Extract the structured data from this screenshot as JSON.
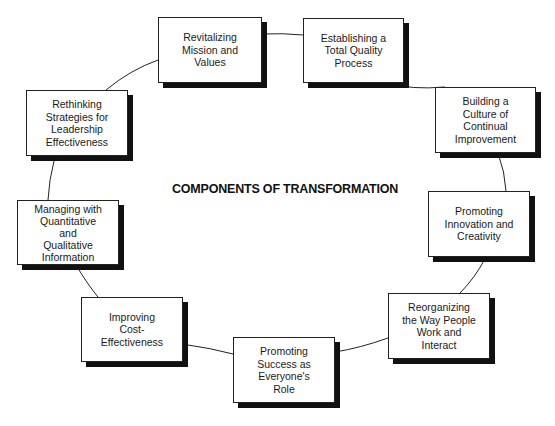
{
  "diagram": {
    "title": "COMPONENTS OF TRANSFORMATION",
    "colors": {
      "stroke": "#222222",
      "shadow": "#111111",
      "background": "#ffffff"
    },
    "nodes": [
      {
        "id": "revitalizing",
        "label": "Revitalizing\nMission and\nValues",
        "x": 158,
        "y": 17,
        "w": 104,
        "h": 66
      },
      {
        "id": "establishing",
        "label": "Establishing a\nTotal Quality\nProcess",
        "x": 303,
        "y": 18,
        "w": 101,
        "h": 65
      },
      {
        "id": "building",
        "label": "Building a\nCulture of\nContinual\nImprovement",
        "x": 435,
        "y": 87,
        "w": 101,
        "h": 66
      },
      {
        "id": "promoting-innovation",
        "label": "Promoting\nInnovation and\nCreativity",
        "x": 428,
        "y": 191,
        "w": 102,
        "h": 66
      },
      {
        "id": "reorganizing",
        "label": "Reorganizing\nthe Way People\nWork and\nInteract",
        "x": 388,
        "y": 293,
        "w": 102,
        "h": 66
      },
      {
        "id": "promoting-success",
        "label": "Promoting\nSuccess as\nEveryone's\nRole",
        "x": 233,
        "y": 337,
        "w": 102,
        "h": 66
      },
      {
        "id": "improving",
        "label": "Improving\nCost-\nEffectiveness",
        "x": 81,
        "y": 297,
        "w": 102,
        "h": 65
      },
      {
        "id": "managing",
        "label": "Managing with\nQuantitative\nand\nQualitative\nInformation",
        "x": 17,
        "y": 200,
        "w": 102,
        "h": 65
      },
      {
        "id": "rethinking",
        "label": "Rethinking\nStrategies for\nLeadership\nEffectiveness",
        "x": 26,
        "y": 90,
        "w": 102,
        "h": 66
      }
    ],
    "edges": [
      [
        "revitalizing",
        "establishing"
      ],
      [
        "establishing",
        "building"
      ],
      [
        "building",
        "promoting-innovation"
      ],
      [
        "promoting-innovation",
        "reorganizing"
      ],
      [
        "reorganizing",
        "promoting-success"
      ],
      [
        "promoting-success",
        "improving"
      ],
      [
        "improving",
        "managing"
      ],
      [
        "managing",
        "rethinking"
      ],
      [
        "rethinking",
        "revitalizing"
      ]
    ]
  }
}
